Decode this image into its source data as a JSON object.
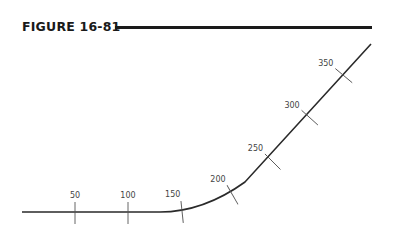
{
  "figure": {
    "title": "FIGURE 16-81"
  },
  "diagram": {
    "type": "track-curve-with-stations",
    "line_color": "#2a2a2a",
    "tick_color": "#555555",
    "stations": [
      {
        "label": "50",
        "x": 75,
        "y": 212,
        "angle": 0
      },
      {
        "label": "100",
        "x": 128,
        "y": 212,
        "angle": 0
      },
      {
        "label": "150",
        "x": 182,
        "y": 211,
        "angle": -6
      },
      {
        "label": "200",
        "x": 232,
        "y": 194,
        "angle": -30
      },
      {
        "label": "250",
        "x": 272,
        "y": 161,
        "angle": -45
      },
      {
        "label": "300",
        "x": 309,
        "y": 117,
        "angle": -48
      },
      {
        "label": "350",
        "x": 343,
        "y": 75,
        "angle": -50
      }
    ]
  }
}
